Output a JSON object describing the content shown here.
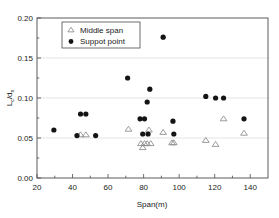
{
  "chart_data": {
    "type": "scatter",
    "title": "",
    "xlabel": "Span(m)",
    "ylabel": "Lc/ds",
    "ylabel_main": "L",
    "ylabel_sub1": "c",
    "ylabel_mid": "/d",
    "ylabel_sub2": "s",
    "xlim": [
      20,
      150
    ],
    "ylim": [
      0.0,
      0.2
    ],
    "xticks": [
      20,
      40,
      60,
      80,
      100,
      120,
      140
    ],
    "xtick_labels": [
      "20",
      "40",
      "60",
      "80",
      "100",
      "120",
      "140"
    ],
    "yticks": [
      0.0,
      0.05,
      0.1,
      0.15,
      0.2
    ],
    "ytick_labels": [
      "0.00",
      "0.05",
      "0.10",
      "0.15",
      "0.20"
    ],
    "grid": "horizontal-minor-gray",
    "legend_position": "top-left-inside",
    "series": [
      {
        "name": "Middle span",
        "marker": "open-triangle",
        "color": "#8a8a8a",
        "points": [
          {
            "x": 44.5,
            "y": 0.054
          },
          {
            "x": 47.5,
            "y": 0.054
          },
          {
            "x": 71.5,
            "y": 0.061
          },
          {
            "x": 78.5,
            "y": 0.043
          },
          {
            "x": 79.5,
            "y": 0.038
          },
          {
            "x": 80.5,
            "y": 0.043
          },
          {
            "x": 82.0,
            "y": 0.043
          },
          {
            "x": 83.0,
            "y": 0.06
          },
          {
            "x": 84.0,
            "y": 0.043
          },
          {
            "x": 91.0,
            "y": 0.057
          },
          {
            "x": 96.0,
            "y": 0.044
          },
          {
            "x": 97.0,
            "y": 0.044
          },
          {
            "x": 115.0,
            "y": 0.047
          },
          {
            "x": 120.5,
            "y": 0.042
          },
          {
            "x": 125.0,
            "y": 0.074
          },
          {
            "x": 136.5,
            "y": 0.056
          }
        ]
      },
      {
        "name": "Suppot point",
        "marker": "filled-circle",
        "color": "#141414",
        "points": [
          {
            "x": 29.5,
            "y": 0.06
          },
          {
            "x": 42.5,
            "y": 0.053
          },
          {
            "x": 44.5,
            "y": 0.08
          },
          {
            "x": 47.5,
            "y": 0.08
          },
          {
            "x": 53.0,
            "y": 0.053
          },
          {
            "x": 71.0,
            "y": 0.125
          },
          {
            "x": 78.0,
            "y": 0.074
          },
          {
            "x": 80.5,
            "y": 0.074
          },
          {
            "x": 79.5,
            "y": 0.055
          },
          {
            "x": 82.5,
            "y": 0.055
          },
          {
            "x": 82.0,
            "y": 0.095
          },
          {
            "x": 83.5,
            "y": 0.111
          },
          {
            "x": 91.0,
            "y": 0.176
          },
          {
            "x": 96.5,
            "y": 0.071
          },
          {
            "x": 97.0,
            "y": 0.055
          },
          {
            "x": 115.0,
            "y": 0.102
          },
          {
            "x": 120.5,
            "y": 0.1
          },
          {
            "x": 125.0,
            "y": 0.1
          },
          {
            "x": 136.5,
            "y": 0.074
          }
        ]
      }
    ],
    "legend_entries": [
      {
        "label": "Middle span",
        "marker": "open-triangle"
      },
      {
        "label": "Suppot point",
        "marker": "filled-circle"
      }
    ]
  }
}
